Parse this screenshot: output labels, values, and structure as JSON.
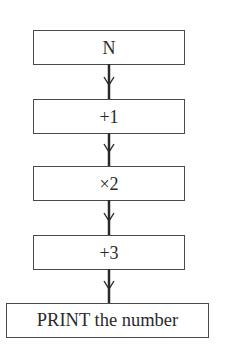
{
  "flowchart": {
    "type": "vertical-flowchart",
    "steps": [
      {
        "id": "start",
        "label": "N"
      },
      {
        "id": "add-one",
        "label": "+1"
      },
      {
        "id": "times-two",
        "label": "×2"
      },
      {
        "id": "add-three",
        "label": "+3"
      },
      {
        "id": "print",
        "label": "PRINT the number"
      }
    ],
    "connectors": [
      {
        "from": "start",
        "to": "add-one",
        "icon": "down-arrow-icon"
      },
      {
        "from": "add-one",
        "to": "times-two",
        "icon": "down-arrow-icon"
      },
      {
        "from": "times-two",
        "to": "add-three",
        "icon": "down-arrow-icon"
      },
      {
        "from": "add-three",
        "to": "print",
        "icon": "down-arrow-icon"
      }
    ],
    "colors": {
      "stroke": "#4a4a4a",
      "text": "#2a2a2a",
      "background": "#ffffff"
    }
  }
}
